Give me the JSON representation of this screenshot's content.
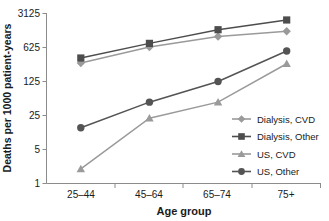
{
  "chart_data": {
    "type": "line",
    "title": "",
    "xlabel": "Age group",
    "ylabel": "Deaths per 1000 patient-years",
    "categories": [
      "25–44",
      "45–64",
      "65–74",
      "75+"
    ],
    "yscale": "log",
    "ylim": [
      1,
      3125
    ],
    "yticks": [
      1,
      5,
      25,
      125,
      625,
      3125
    ],
    "ytick_labels": [
      "1",
      "5",
      "25",
      "125",
      "625",
      "3125"
    ],
    "grid": false,
    "legend_position": "center-right",
    "series": [
      {
        "name": "Dialysis, CVD",
        "marker": "diamond",
        "color": "#9a9a9a",
        "values": [
          300,
          640,
          1050,
          1350
        ]
      },
      {
        "name": "Dialysis, Other",
        "marker": "square",
        "color": "#4d4d4d",
        "values": [
          380,
          760,
          1450,
          2300
        ]
      },
      {
        "name": "US, CVD",
        "marker": "triangle",
        "color": "#9a9a9a",
        "values": [
          2,
          22,
          47,
          290
        ]
      },
      {
        "name": "US, Other",
        "marker": "circle",
        "color": "#545454",
        "values": [
          14,
          47,
          125,
          530
        ]
      }
    ]
  },
  "axes": {
    "x_label": "Age group",
    "y_label": "Deaths per 1000 patient-years",
    "x_tick_labels": [
      "25–44",
      "45–64",
      "65–74",
      "75+"
    ],
    "y_tick_labels": [
      "3125",
      "625",
      "125",
      "25",
      "5",
      "1"
    ]
  },
  "legend": {
    "items": [
      {
        "label": "Dialysis, CVD",
        "marker": "diamond-marker",
        "color": "#9a9a9a"
      },
      {
        "label": "Dialysis, Other",
        "marker": "square-marker",
        "color": "#4d4d4d"
      },
      {
        "label": "US, CVD",
        "marker": "triangle-marker",
        "color": "#9a9a9a"
      },
      {
        "label": "US, Other",
        "marker": "circle-marker",
        "color": "#545454"
      }
    ]
  },
  "colors": {
    "axis": "#8c8c8c",
    "text": "#1a1a1a",
    "background": "#ffffff"
  }
}
